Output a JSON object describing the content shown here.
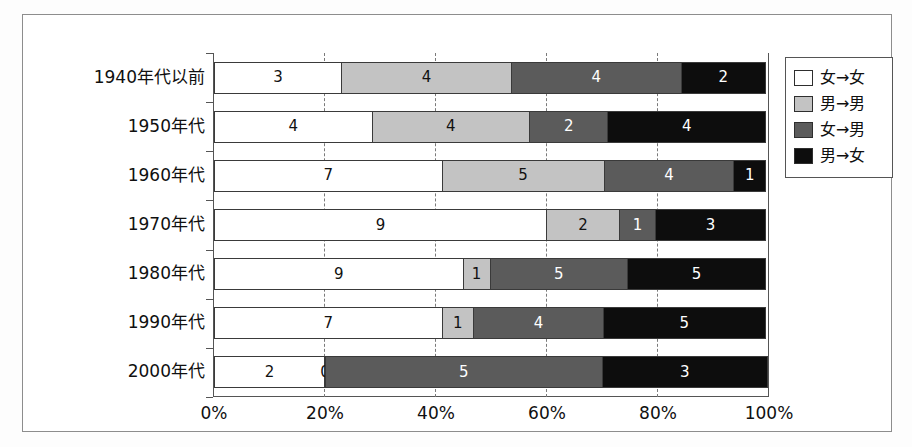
{
  "chart_data": {
    "type": "bar",
    "orientation": "horizontal",
    "stacked": true,
    "normalized_percent": true,
    "title": "",
    "subtitle": "",
    "xlabel": "",
    "ylabel": "",
    "xlim": [
      0,
      100
    ],
    "x_tick_labels": [
      "0%",
      "20%",
      "40%",
      "60%",
      "80%",
      "100%"
    ],
    "x_tick_values": [
      0,
      20,
      40,
      60,
      80,
      100
    ],
    "grid": "vertical-dashed",
    "legend_position": "top-right-outside",
    "categories": [
      "1940年代以前",
      "1950年代",
      "1960年代",
      "1970年代",
      "1980年代",
      "1990年代",
      "2000年代"
    ],
    "series": [
      {
        "name": "女→女",
        "color": "#ffffff",
        "values": [
          3,
          4,
          7,
          9,
          9,
          7,
          2
        ]
      },
      {
        "name": "男→男",
        "color": "#c3c3c3",
        "values": [
          4,
          4,
          5,
          2,
          1,
          1,
          0
        ]
      },
      {
        "name": "女→男",
        "color": "#5b5b5b",
        "values": [
          4,
          2,
          4,
          1,
          5,
          4,
          5
        ]
      },
      {
        "name": "男→女",
        "color": "#0d0d0d",
        "values": [
          2,
          4,
          1,
          3,
          5,
          5,
          3
        ]
      }
    ],
    "row_totals": [
      13,
      14,
      17,
      15,
      20,
      17,
      10
    ],
    "bar_labels": [
      [
        "3",
        "4",
        "4",
        "2"
      ],
      [
        "4",
        "4",
        "2",
        "4"
      ],
      [
        "7",
        "5",
        "4",
        "1"
      ],
      [
        "9",
        "2",
        "1",
        "3"
      ],
      [
        "9",
        "1",
        "5",
        "5"
      ],
      [
        "7",
        "1",
        "4",
        "5"
      ],
      [
        "2",
        "0",
        "5",
        "3"
      ]
    ]
  },
  "legend": {
    "items": [
      {
        "label": "女→女",
        "swatch": "c0"
      },
      {
        "label": "男→男",
        "swatch": "c1"
      },
      {
        "label": "女→男",
        "swatch": "c2"
      },
      {
        "label": "男→女",
        "swatch": "c3"
      }
    ]
  }
}
